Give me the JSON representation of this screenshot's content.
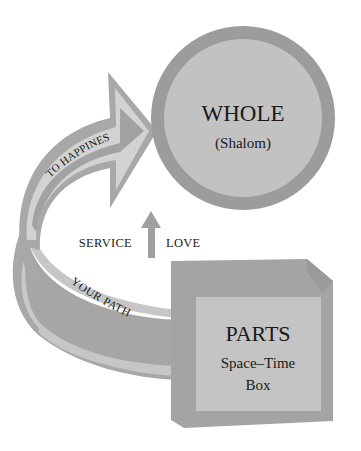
{
  "diagram": {
    "whole": {
      "title": "WHOLE",
      "subtitle": "(Shalom)"
    },
    "parts": {
      "title": "PARTS",
      "line1": "Space–Time",
      "line2": "Box"
    },
    "arrow_to_whole": {
      "label": "TO HAPPINES"
    },
    "path_band": {
      "label": "YOUR PATH"
    },
    "up_arrow": {
      "left_label": "SERVICE",
      "right_label": "LOVE"
    },
    "colors": {
      "background": "#ffffff",
      "dark_gray": "#9a9a9a",
      "mid_gray": "#a8a8a8",
      "light_gray": "#c4c4c4",
      "lighter_gray": "#d4d4d4",
      "text": "#1a1a1a"
    }
  }
}
